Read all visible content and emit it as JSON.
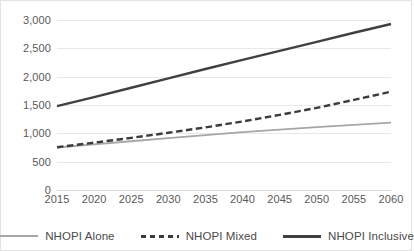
{
  "chart_data": {
    "type": "line",
    "title": "",
    "subtitle": "",
    "xlabel": "",
    "ylabel": "",
    "x": [
      2015,
      2020,
      2025,
      2030,
      2035,
      2040,
      2045,
      2050,
      2055,
      2060
    ],
    "xtick_labels": [
      "2015",
      "2020",
      "2025",
      "2030",
      "2035",
      "2040",
      "2045",
      "2050",
      "2055",
      "2060"
    ],
    "ytick_labels": [
      "0",
      "500",
      "1,000",
      "1,500",
      "2,000",
      "2,500",
      "3,000"
    ],
    "ytick_values": [
      0,
      500,
      1000,
      1500,
      2000,
      2500,
      3000
    ],
    "xlim": [
      2015,
      2060
    ],
    "ylim": [
      0,
      3000
    ],
    "grid": true,
    "legend_position": "bottom",
    "series": [
      {
        "name": "NHOPI Alone",
        "style": "solid",
        "color": "#a6a6a6",
        "values": [
          750,
          805,
          860,
          915,
          970,
          1020,
          1065,
          1110,
          1150,
          1190
        ]
      },
      {
        "name": "NHOPI Mixed",
        "style": "dashed",
        "color": "#3b3b3b",
        "values": [
          755,
          835,
          920,
          1010,
          1105,
          1210,
          1325,
          1450,
          1590,
          1735
        ]
      },
      {
        "name": "NHOPI Inclusive",
        "style": "solid",
        "color": "#404040",
        "values": [
          1480,
          1640,
          1805,
          1970,
          2135,
          2295,
          2455,
          2615,
          2775,
          2930
        ]
      }
    ]
  },
  "legend": {
    "items": [
      {
        "label": "NHOPI Alone",
        "swatch": "line-swatch-solid-light"
      },
      {
        "label": "NHOPI Mixed",
        "swatch": "line-swatch-dashed-dark"
      },
      {
        "label": "NHOPI Inclusive",
        "swatch": "line-swatch-solid-dark"
      }
    ]
  },
  "colors": {
    "alone": "#a6a6a6",
    "mixed": "#3b3b3b",
    "inclusive": "#404040",
    "gridline": "#e8e8e8",
    "axis_text": "#595959",
    "legend_text": "#4a4a4a",
    "frame": "#e3e3e3",
    "background": "#ffffff"
  }
}
